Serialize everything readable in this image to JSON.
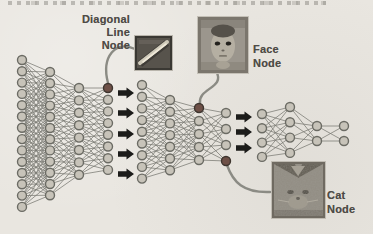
{
  "page": {
    "type": "scanned-book-figure",
    "background_paper": "#e9e6e0"
  },
  "colors": {
    "node_fill": "#c7c3b9",
    "node_stroke": "#6b6b64",
    "highlight_fill": "#6e5047",
    "highlight_stroke": "#3e352f",
    "edge": "#7b7b74",
    "block_arrow": "#1c1c1a",
    "curve": "#8b8b84",
    "label_text": "#4e4b46"
  },
  "annotations": {
    "diagonal_line": {
      "label_lines": [
        "Diagonal",
        "Line",
        "Node"
      ],
      "patch_icon": "diagonal-line-patch"
    },
    "face": {
      "label_lines": [
        "Face",
        "Node"
      ],
      "patch_icon": "face-photo-patch"
    },
    "cat": {
      "label_lines": [
        "Cat",
        "Node"
      ],
      "patch_icon": "cat-photo-patch"
    }
  },
  "diagram": {
    "node_radius": 4.5,
    "networks": [
      {
        "id": "first-network",
        "columns": [
          {
            "x": 22,
            "yTop": 60,
            "count": 14,
            "dy": 11.3,
            "highlight": []
          },
          {
            "x": 50,
            "yTop": 72,
            "count": 12,
            "dy": 11.2,
            "highlight": []
          },
          {
            "x": 79,
            "yTop": 88,
            "count": 8,
            "dy": 12.4,
            "highlight": []
          },
          {
            "x": 108,
            "yTop": 88,
            "count": 8,
            "dy": 11.7,
            "highlight": [
              0
            ]
          }
        ],
        "thresholds": [
          46,
          36,
          36
        ]
      },
      {
        "id": "middle-network",
        "columns": [
          {
            "x": 142,
            "yTop": 85,
            "count": 9,
            "dy": 11.7,
            "highlight": []
          },
          {
            "x": 170,
            "yTop": 100,
            "count": 7,
            "dy": 11.7,
            "highlight": []
          },
          {
            "x": 199,
            "yTop": 108,
            "count": 5,
            "dy": 13,
            "highlight": [
              0
            ]
          },
          {
            "x": 226,
            "yTop": 113,
            "count": 4,
            "dy": 16,
            "highlight": [
              3
            ]
          }
        ],
        "thresholds": [
          38,
          38,
          38
        ]
      },
      {
        "id": "output-network",
        "columns": [
          {
            "x": 262,
            "yTop": 114,
            "count": 4,
            "dy": 14.3,
            "highlight": []
          },
          {
            "x": 290,
            "yTop": 107,
            "count": 4,
            "dy": 15.3,
            "highlight": []
          },
          {
            "x": 317,
            "yTop": 126,
            "count": 2,
            "dy": 15,
            "highlight": []
          },
          {
            "x": 344,
            "yTop": 126,
            "count": 2,
            "dy": 15,
            "highlight": []
          }
        ],
        "thresholds": [
          48,
          42,
          32
        ]
      }
    ],
    "block_arrows": [
      {
        "id": "stage1-arrows",
        "x": 118,
        "ys": [
          93,
          113,
          134,
          154,
          174
        ]
      },
      {
        "id": "stage2-arrows",
        "x": 236,
        "ys": [
          117,
          132,
          148
        ]
      }
    ],
    "curves": [
      {
        "id": "diagonal-patch-connector",
        "d": "M 135,49 C 116,40 101,56 108,83"
      },
      {
        "id": "face-patch-connector",
        "d": "M 216,71 C 226,88 198,88 200,103"
      },
      {
        "id": "cat-patch-connector",
        "d": "M 227,165 C 233,182 243,193 270,192"
      }
    ]
  }
}
